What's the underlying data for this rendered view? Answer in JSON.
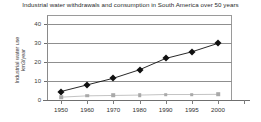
{
  "chart_data": {
    "type": "line",
    "title": "Industrial water withdrawals and consumption in South America over 50 years",
    "xlabel": "",
    "ylabel": "Industrial water use\nkm3/year",
    "ylabel_line1": "Industrial water use",
    "ylabel_line2": "km3/year",
    "categories": [
      "1950",
      "1960",
      "1970",
      "1980",
      "1990",
      "1995",
      "2000"
    ],
    "x": [
      1950,
      1960,
      1970,
      1980,
      1990,
      1995,
      2000
    ],
    "ylim": [
      0,
      45
    ],
    "yticks": [
      0,
      10,
      20,
      30,
      40
    ],
    "ytick_labels": [
      "0",
      "10",
      "20",
      "30",
      "40"
    ],
    "grid": true,
    "legend": "none",
    "series": [
      {
        "name": "Industrial water withdrawals",
        "marker": "diamond",
        "color": "#101010",
        "values": [
          4.5,
          8.0,
          11.5,
          16.0,
          22.0,
          25.5,
          30.0
        ]
      },
      {
        "name": "Industrial water consumption",
        "marker": "square",
        "color": "#a9a9a9",
        "values": [
          1.5,
          2.2,
          2.4,
          2.6,
          2.9,
          2.9,
          3.0
        ]
      }
    ]
  },
  "colors": {
    "series1": "#101010",
    "series2": "#a9a9a9",
    "grid": "#8f8f8f",
    "axis": "#6f6f6f",
    "text": "#2f2f2f",
    "background": "#ffffff"
  }
}
